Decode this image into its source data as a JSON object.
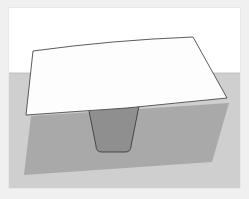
{
  "figure": {
    "title": "3D rendering of a flat plane resting on a tapered column",
    "caption": "",
    "canvas": {
      "width": 249,
      "height": 199
    },
    "border": {
      "color": "#e8e8e8",
      "inset_left": 8,
      "inset_top": 7,
      "inset_right": 8,
      "inset_bottom": 10
    },
    "background": {
      "sky_color": "#ffffff",
      "ground_color": "#cfcfcf",
      "horizon_y": 73
    },
    "objects": [
      {
        "name": "ground-plane",
        "label": "Ground plane",
        "fill": "#cfcfcf",
        "stroke": "none",
        "points": "9,73 241,73 241,189 9,189"
      },
      {
        "name": "cast-shadow",
        "label": "Cast shadow quadrilateral",
        "fill": "#a9a9a9",
        "stroke": "none",
        "points": "31,116 229,103 212,162 24,175"
      },
      {
        "name": "column",
        "label": "Tapered support column",
        "fill": "#8f8f8f",
        "stroke": "#3d3d3d",
        "stroke_width": 0.9,
        "top_left_x": 88,
        "top_right_x": 139,
        "top_y": 106,
        "bottom_left_x": 96,
        "bottom_right_x": 131,
        "bottom_y": 152,
        "corner_radius": 6
      },
      {
        "name": "sheet-plane",
        "label": "White sheet / table top",
        "fill": "#fdfdfd",
        "stroke": "#4a4a4a",
        "stroke_width": 0.9,
        "points": "33,51 193,37 227,98 26,115"
      }
    ],
    "colors": {
      "sky": "#ffffff",
      "ground": "#cfcfcf",
      "shadow": "#a9a9a9",
      "column_fill": "#8f8f8f",
      "column_stroke": "#3d3d3d",
      "sheet_fill": "#fdfdfd",
      "sheet_stroke": "#4a4a4a",
      "frame": "#e8e8e8"
    }
  }
}
